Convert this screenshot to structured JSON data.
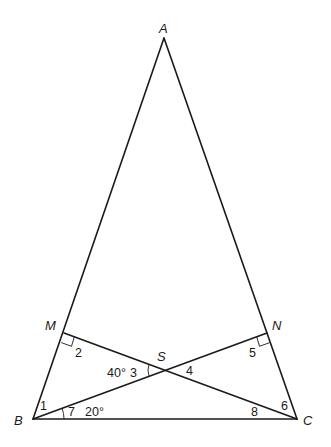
{
  "diagram": {
    "type": "geometry",
    "vertices": [
      {
        "id": "A",
        "label": "A",
        "x": 164,
        "y": 38,
        "lx": 159,
        "ly": 33
      },
      {
        "id": "B",
        "label": "B",
        "x": 33,
        "y": 419,
        "lx": 14,
        "ly": 425
      },
      {
        "id": "C",
        "label": "C",
        "x": 297,
        "y": 419,
        "lx": 303,
        "ly": 425
      },
      {
        "id": "M",
        "label": "M",
        "x": 64,
        "y": 333,
        "lx": 45,
        "ly": 330
      },
      {
        "id": "N",
        "label": "N",
        "x": 267,
        "y": 333,
        "lx": 272,
        "ly": 330
      },
      {
        "id": "S",
        "label": "S",
        "x": 165,
        "y": 370,
        "lx": 157,
        "ly": 361
      }
    ],
    "segments": [
      {
        "from": "A",
        "to": "B"
      },
      {
        "from": "A",
        "to": "C"
      },
      {
        "from": "B",
        "to": "C"
      },
      {
        "from": "M",
        "to": "C"
      },
      {
        "from": "B",
        "to": "N"
      }
    ],
    "angle_labels": [
      {
        "id": "angle-1",
        "text": "1",
        "x": 40,
        "y": 410
      },
      {
        "id": "angle-2",
        "text": "2",
        "x": 75,
        "y": 357
      },
      {
        "id": "angle-3",
        "text": "3",
        "x": 130,
        "y": 377
      },
      {
        "id": "angle-4",
        "text": "4",
        "x": 186,
        "y": 375
      },
      {
        "id": "angle-5",
        "text": "5",
        "x": 249,
        "y": 357
      },
      {
        "id": "angle-6",
        "text": "6",
        "x": 281,
        "y": 410
      },
      {
        "id": "angle-7",
        "text": "7",
        "x": 68,
        "y": 416
      },
      {
        "id": "angle-8",
        "text": "8",
        "x": 251,
        "y": 416
      }
    ],
    "given_values": [
      {
        "id": "given-40",
        "text": "40°",
        "x": 107,
        "y": 377,
        "refers_to": "angle-3"
      },
      {
        "id": "given-20",
        "text": "20°",
        "x": 85,
        "y": 416,
        "refers_to": "angle-7"
      }
    ],
    "right_angles": [
      "M",
      "N"
    ],
    "arcs": [
      "angle-3",
      "angle-7"
    ]
  }
}
